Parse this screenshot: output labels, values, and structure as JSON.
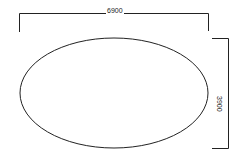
{
  "diagram": {
    "shape": "ellipse",
    "width_dimension": "6900",
    "height_dimension": "3900",
    "stroke_color": "#222222",
    "background_color": "#ffffff"
  }
}
